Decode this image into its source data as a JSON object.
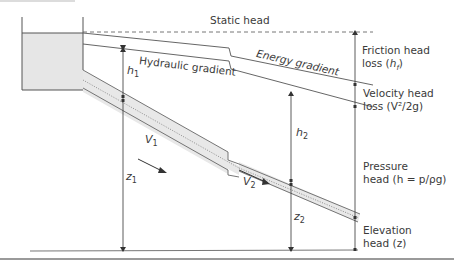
{
  "diagram": {
    "labels": {
      "static_head": "Static head",
      "energy_gradient": "Energy gradient",
      "hydraulic_gradient": "Hydraulic gradient",
      "friction_head_loss_line1": "Friction head",
      "friction_head_loss_line2": "loss (",
      "friction_head_loss_sym": "h",
      "friction_head_loss_sub": "f",
      "friction_head_loss_end": ")",
      "velocity_head_loss_line1": "Velocity head",
      "velocity_head_loss_line2": "loss (V²/2g)",
      "pressure_head_line1": "Pressure",
      "pressure_head_line2": "head (h = p/ρg)",
      "elevation_head_line1": "Elevation",
      "elevation_head_line2": "head (z)"
    },
    "symbols": {
      "h1": "h",
      "h1_sub": "1",
      "h2": "h",
      "h2_sub": "2",
      "z1": "z",
      "z1_sub": "1",
      "z2": "z",
      "z2_sub": "2",
      "v1": "V",
      "v1_sub": "1",
      "v2": "V",
      "v2_sub": "2"
    },
    "colors": {
      "line": "#555555",
      "reservoir_fill": "#e6e6e6",
      "pipe_fill": "#e8e8e8",
      "text": "#3a3a3a"
    }
  }
}
